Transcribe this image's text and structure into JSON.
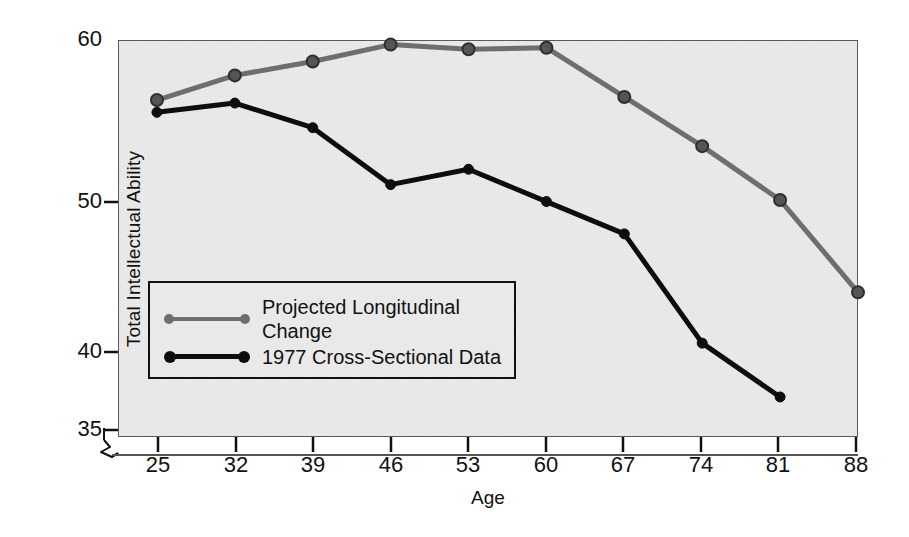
{
  "chart_data": {
    "type": "line",
    "title": "",
    "xlabel": "Age",
    "ylabel": "Total Intellectual Ability",
    "x": [
      25,
      32,
      39,
      46,
      53,
      60,
      67,
      74,
      81,
      88
    ],
    "xtick_labels": [
      "25",
      "32",
      "39",
      "46",
      "53",
      "60",
      "67",
      "74",
      "81",
      "88"
    ],
    "ytick_labels": [
      "60",
      "50",
      "40",
      "35"
    ],
    "ytick_values": [
      60,
      50,
      40,
      35
    ],
    "xlim": [
      21.5,
      88
    ],
    "ylim": [
      34.2,
      60
    ],
    "grid": false,
    "axis_break": true,
    "legend_position": "inside-lower-left",
    "series": [
      {
        "name": "Projected Longitudinal Change",
        "color": "#6e6e6e",
        "marker": "circle",
        "x": [
          25,
          32,
          39,
          46,
          53,
          60,
          67,
          74,
          81,
          88
        ],
        "values": [
          56.1,
          57.7,
          58.6,
          59.7,
          59.4,
          59.5,
          56.3,
          53.1,
          49.6,
          43.6
        ]
      },
      {
        "name": "1977 Cross-Sectional Data",
        "color": "#0d0d0d",
        "marker": "circle",
        "x": [
          25,
          32,
          39,
          46,
          53,
          60,
          67,
          74,
          81
        ],
        "values": [
          55.3,
          55.9,
          54.3,
          50.6,
          51.6,
          49.5,
          47.4,
          40.3,
          36.8
        ]
      }
    ]
  },
  "legend": {
    "items": [
      {
        "label": "Projected Longitudinal\nChange",
        "color": "#6e6e6e"
      },
      {
        "label": "1977 Cross-Sectional Data",
        "color": "#0d0d0d"
      }
    ]
  }
}
